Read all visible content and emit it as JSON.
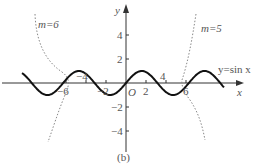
{
  "chart_data": {
    "type": "line",
    "title": "",
    "caption": "(b)",
    "xlabel": "x",
    "ylabel": "y",
    "origin_label": "O",
    "x_ticks": [
      -6,
      -4,
      -2,
      2,
      4,
      6
    ],
    "x_tick_labels": [
      "−6",
      "−4",
      "−2",
      "2",
      "4",
      "6"
    ],
    "y_ticks": [
      -4,
      -2,
      2,
      4
    ],
    "y_tick_labels": [
      "−4",
      "−2",
      "2",
      "4"
    ],
    "xlim": [
      -10.5,
      10
    ],
    "ylim": [
      -5,
      6.5
    ],
    "grid": false,
    "series": [
      {
        "name": "y=sin x",
        "style": "solid",
        "function": "sin(x)",
        "x_range": [
          -10.4,
          9.8
        ]
      },
      {
        "name": "m=6",
        "style": "dotted",
        "points": [
          [
            -9.1,
            5.8
          ],
          [
            -8.4,
            3.5
          ],
          [
            -7.6,
            1.8
          ],
          [
            -6.9,
            0.8
          ],
          [
            -6.3,
            0.0
          ],
          [
            -6.7,
            -1.5
          ],
          [
            -7.2,
            -3.0
          ],
          [
            -7.8,
            -4.6
          ]
        ]
      },
      {
        "name": "m=5",
        "style": "dotted",
        "points": [
          [
            7.0,
            5.8
          ],
          [
            6.6,
            3.5
          ],
          [
            6.1,
            1.5
          ],
          [
            5.5,
            0.0
          ],
          [
            5.9,
            -0.8
          ],
          [
            6.7,
            -1.8
          ],
          [
            7.2,
            -3.0
          ],
          [
            7.6,
            -4.4
          ]
        ]
      }
    ],
    "annotations": [
      {
        "text": "m=6",
        "x": -8.3,
        "y": 5.1
      },
      {
        "text": "m=5",
        "x": 7.6,
        "y": 4.7
      },
      {
        "text": "y=sin x",
        "x": 7.2,
        "y": 1.6
      }
    ]
  },
  "labels": {
    "x_axis": "x",
    "y_axis": "y",
    "origin": "O",
    "caption": "(b)",
    "m6": "m=6",
    "m5": "m=5",
    "sin": "y=sin x",
    "xt_m6": "−6",
    "xt_m4": "−4",
    "xt_m2": "−2",
    "xt_2": "2",
    "xt_4": "4",
    "xt_6": "6",
    "yt_4": "4",
    "yt_2": "2",
    "yt_m2": "−2",
    "yt_m4": "−4"
  }
}
